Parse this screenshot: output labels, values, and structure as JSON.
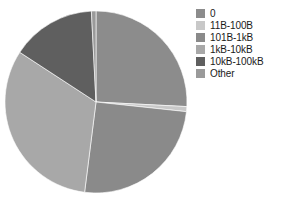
{
  "chart_data": {
    "type": "pie",
    "title": "",
    "subtitle": "",
    "xlabel": "",
    "ylabel": "",
    "legend_position": "right",
    "grid": false,
    "start_angle_deg": 0,
    "direction": "clockwise",
    "center": {
      "x": 96,
      "y": 102
    },
    "radius": 91,
    "categories": [
      "0",
      "11B-100B",
      "101B-1kB",
      "1kB-10kB",
      "10kB-100kB",
      "Other"
    ],
    "values": [
      25.8,
      0.9,
      25.3,
      32.2,
      15.0,
      0.8
    ],
    "colors": [
      "#8c8c8c",
      "#c8c8c8",
      "#8a8a8a",
      "#a8a8a8",
      "#5f5f5f",
      "#9a9a9a"
    ],
    "slices": [
      {
        "label": "0",
        "value": 25.8,
        "color": "#8c8c8c",
        "start_deg": 0.0,
        "end_deg": 92.9
      },
      {
        "label": "11B-100B",
        "value": 0.9,
        "color": "#c8c8c8",
        "start_deg": 92.9,
        "end_deg": 96.1
      },
      {
        "label": "101B-1kB",
        "value": 25.3,
        "color": "#8a8a8a",
        "start_deg": 96.1,
        "end_deg": 187.2
      },
      {
        "label": "1kB-10kB",
        "value": 32.2,
        "color": "#a8a8a8",
        "start_deg": 187.2,
        "end_deg": 303.1
      },
      {
        "label": "10kB-100kB",
        "value": 15.0,
        "color": "#5f5f5f",
        "start_deg": 303.1,
        "end_deg": 357.1
      },
      {
        "label": "Other",
        "value": 0.8,
        "color": "#9a9a9a",
        "start_deg": 357.1,
        "end_deg": 360.0
      }
    ]
  },
  "legend": {
    "items": [
      {
        "label": "0",
        "color": "#8c8c8c"
      },
      {
        "label": "11B-100B",
        "color": "#c8c8c8"
      },
      {
        "label": "101B-1kB",
        "color": "#8a8a8a"
      },
      {
        "label": "1kB-10kB",
        "color": "#a8a8a8"
      },
      {
        "label": "10kB-100kB",
        "color": "#5f5f5f"
      },
      {
        "label": "Other",
        "color": "#9a9a9a"
      }
    ]
  }
}
